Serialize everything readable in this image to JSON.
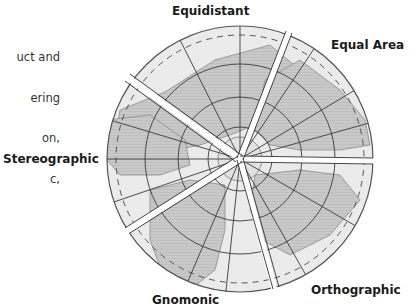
{
  "caption": {
    "lines": [
      "uct and",
      "ering",
      "on,",
      "c,"
    ]
  },
  "diagram": {
    "center": [
      240,
      159
    ],
    "radius": 133,
    "colors": {
      "land": "#c9c9c9",
      "ocean": "#ebebeb",
      "grid": "#3a3a3a",
      "outline": "#555555",
      "gap": "#ffffff"
    },
    "wedges": [
      {
        "name": "Equidistant",
        "start_deg": 69,
        "end_deg": 144
      },
      {
        "name": "Equal Area",
        "start_deg": -1,
        "end_deg": 69
      },
      {
        "name": "Orthographic",
        "start_deg": -75,
        "end_deg": -1
      },
      {
        "name": "Gnomonic",
        "start_deg": -148,
        "end_deg": -75
      },
      {
        "name": "Stereographic",
        "start_deg": 144,
        "end_deg": 212
      }
    ]
  },
  "labels": {
    "equidistant": "Equidistant",
    "equal_area": "Equal Area",
    "stereographic": "Stereographic",
    "gnomonic": "Gnomonic",
    "orthographic": "Orthographic"
  }
}
